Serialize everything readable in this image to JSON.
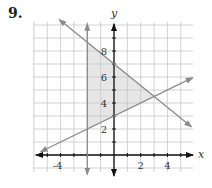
{
  "problem_number": "9.",
  "chart_data": {
    "type": "line",
    "title": "",
    "xlabel": "x",
    "ylabel": "y",
    "xlim": [
      -5.5,
      5.5
    ],
    "ylim": [
      -1.2,
      10.3
    ],
    "grid": true,
    "x_tick_labels": [
      "-4",
      "2",
      "4"
    ],
    "y_tick_labels": [
      "2",
      "4",
      "6",
      "8"
    ],
    "series": [
      {
        "name": "vertical line",
        "equation": "x = -2",
        "style": "arrows both ends"
      },
      {
        "name": "decreasing line",
        "equation": "y = -5/6 x + 7",
        "style": "arrows both ends"
      },
      {
        "name": "increasing line",
        "equation": "y = 1/2 x + 3",
        "style": "arrows both ends"
      }
    ],
    "shaded_region": {
      "description": "triangle bounded by x >= -2, y <= -5/6x+7, y >= 1/2x+3",
      "vertices": [
        [
          -2,
          8.67
        ],
        [
          -2,
          2
        ],
        [
          3,
          4.5
        ]
      ],
      "color": "#e6e6e6"
    }
  },
  "colors": {
    "grid": "#c8c8c8",
    "axes": "#111111",
    "lines": "#8a8a8a",
    "shade": "#e6e6e6"
  }
}
